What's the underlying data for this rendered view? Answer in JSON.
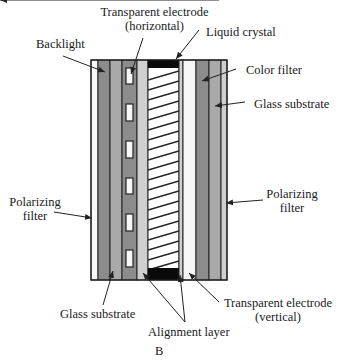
{
  "figure": {
    "caption": "B"
  },
  "labels": {
    "transparent_electrode_horizontal": {
      "line1": "Transparent electrode",
      "line2": "(horizontal)"
    },
    "liquid_crystal": "Liquid crystal",
    "backlight": "Backlight",
    "color_filter": "Color filter",
    "glass_substrate_right": "Glass substrate",
    "polarizing_filter_left": {
      "line1": "Polarizing",
      "line2": "filter"
    },
    "polarizing_filter_right": {
      "line1": "Polarizing",
      "line2": "filter"
    },
    "glass_substrate_bottom": "Glass substrate",
    "alignment_layer": "Alignment layer",
    "transparent_electrode_vertical": {
      "line1": "Transparent electrode",
      "line2": "(vertical)"
    }
  },
  "colors": {
    "outline": "#222222",
    "white_layer": "#f7f7f7",
    "dark_gray": "#8c8c8c",
    "mid_gray": "#a9a9a9",
    "light_gray": "#cfcfcf",
    "seal_black": "#0a0a0a"
  }
}
